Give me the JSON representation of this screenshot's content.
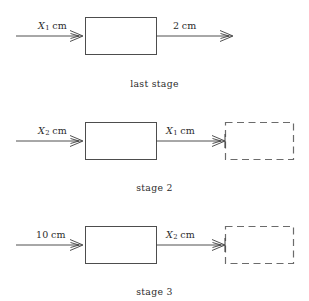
{
  "figure": {
    "type": "block-flow-diagram",
    "background_color": "#ffffff",
    "line_color": "#3d3d3d",
    "box_stroke_color": "#4d4d4d",
    "dashed_box_stroke_color": "#6b6b6b"
  },
  "stages": [
    {
      "caption": "last stage",
      "input": {
        "symbol": "X",
        "subscript": "1",
        "unit": "cm"
      },
      "output": {
        "symbol": "2",
        "subscript": "",
        "unit": "cm"
      },
      "has_dashed_placeholder": false
    },
    {
      "caption": "stage 2",
      "input": {
        "symbol": "X",
        "subscript": "2",
        "unit": "cm"
      },
      "output": {
        "symbol": "X",
        "subscript": "1",
        "unit": "cm"
      },
      "has_dashed_placeholder": true
    },
    {
      "caption": "stage 3",
      "input": {
        "symbol": "10",
        "subscript": "",
        "unit": "cm"
      },
      "output": {
        "symbol": "X",
        "subscript": "2",
        "unit": "cm"
      },
      "has_dashed_placeholder": true
    }
  ],
  "labels": {
    "s1_in_var": "X",
    "s1_in_sub": "1",
    "s1_in_unit": "cm",
    "s1_out_var": "2",
    "s1_out_unit": "cm",
    "s1_caption": "last stage",
    "s2_in_var": "X",
    "s2_in_sub": "2",
    "s2_in_unit": "cm",
    "s2_out_var": "X",
    "s2_out_sub": "1",
    "s2_out_unit": "cm",
    "s2_caption": "stage 2",
    "s3_in_var": "10",
    "s3_in_unit": "cm",
    "s3_out_var": "X",
    "s3_out_sub": "2",
    "s3_out_unit": "cm",
    "s3_caption": "stage 3"
  }
}
